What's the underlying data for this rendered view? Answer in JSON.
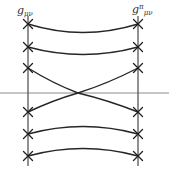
{
  "figure": {
    "title": "",
    "background_color": "#ffffff",
    "width": 169,
    "height": 173,
    "labels": {
      "left": {
        "base": "g",
        "subscript": "μν",
        "superscript": "",
        "full": "gμν"
      },
      "right": {
        "base": "g",
        "subscript": "μν",
        "superscript": "π",
        "full": "gπμν"
      }
    },
    "colors": {
      "curve": "#262626",
      "vertical_line": "#55565a",
      "horizontal_line": "#8a8c90",
      "tick_mark": "#1f1f1f",
      "label_text": "#2b2b2b"
    }
  },
  "chart_data": {
    "type": "line",
    "title": "",
    "xlabel": "",
    "ylabel": "",
    "xlim": [
      0,
      169
    ],
    "ylim": [
      0,
      173
    ],
    "grid": false,
    "legend": null,
    "vertical_lines": [
      {
        "name": "left-boundary",
        "x": 28,
        "y_top": 16,
        "y_bottom": 166,
        "label": "gμν"
      },
      {
        "name": "right-boundary",
        "x": 138,
        "y_top": 16,
        "y_bottom": 166,
        "label": "gπμν"
      }
    ],
    "horizontal_line": {
      "name": "axis",
      "y": 93,
      "x_start": 0,
      "x_end": 169
    },
    "tick_marks": {
      "style": "x-cross",
      "size": 9,
      "left_x": 28,
      "right_x": 138,
      "y_positions": [
        24,
        47,
        68,
        112,
        134,
        156
      ]
    },
    "curves": [
      {
        "name": "curve-1-top-sag",
        "start": [
          28,
          24
        ],
        "end": [
          138,
          24
        ],
        "control": [
          83,
          41
        ],
        "shape": "concave-up"
      },
      {
        "name": "curve-2-sag",
        "start": [
          28,
          47
        ],
        "end": [
          138,
          47
        ],
        "control": [
          83,
          62
        ],
        "shape": "concave-up"
      },
      {
        "name": "curve-3-descending-cross",
        "start": [
          28,
          68
        ],
        "end": [
          138,
          112
        ],
        "control": [
          83,
          104
        ],
        "shape": "crossing"
      },
      {
        "name": "curve-4-ascending-cross",
        "start": [
          28,
          112
        ],
        "end": [
          138,
          68
        ],
        "control": [
          83,
          104
        ],
        "shape": "crossing"
      },
      {
        "name": "curve-5-arch",
        "start": [
          28,
          134
        ],
        "end": [
          138,
          134
        ],
        "control": [
          83,
          119
        ],
        "shape": "concave-down"
      },
      {
        "name": "curve-6-bottom-arch",
        "start": [
          28,
          156
        ],
        "end": [
          138,
          156
        ],
        "control": [
          83,
          141
        ],
        "shape": "concave-down"
      }
    ],
    "crossing_point": [
      78,
      93
    ],
    "annotations": []
  }
}
